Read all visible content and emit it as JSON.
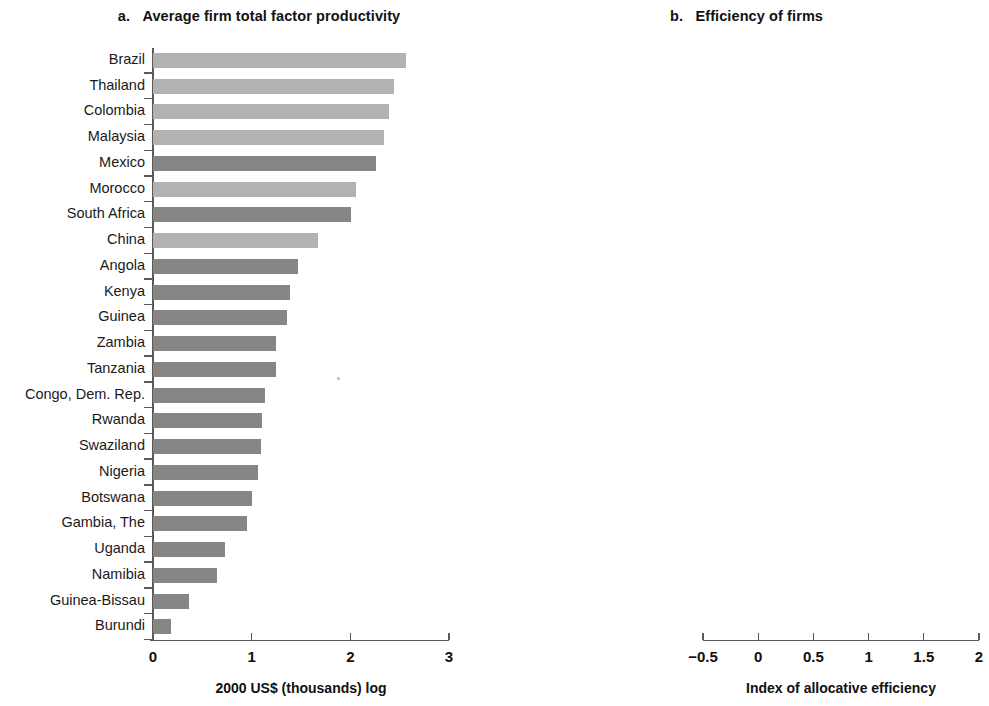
{
  "figure": {
    "panel_a_label": "a.",
    "panel_a_title": "Average firm total factor productivity",
    "panel_b_label": "b.",
    "panel_b_title": "Efficiency of firms",
    "colors": {
      "light_bar": "#b2b2b2",
      "dark_bar": "#868686",
      "axis": "#5a5a5a",
      "text": "#1a1a1a"
    }
  },
  "chart_data": [
    {
      "type": "bar",
      "orientation": "horizontal",
      "panel": "a",
      "title": "a.  Average firm total factor productivity",
      "xlabel": "2000 US$ (thousands) log",
      "ylabel": "",
      "xlim": [
        0,
        3
      ],
      "xticks": [
        0,
        1,
        2,
        3
      ],
      "xticklabels": [
        "0",
        "1",
        "2",
        "3"
      ],
      "grid": false,
      "legend": "none",
      "categories": [
        "Brazil",
        "Thailand",
        "Colombia",
        "Malaysia",
        "Mexico",
        "Morocco",
        "South Africa",
        "China",
        "Angola",
        "Kenya",
        "Guinea",
        "Zambia",
        "Tanzania",
        "Congo, Dem. Rep.",
        "Rwanda",
        "Swaziland",
        "Nigeria",
        "Botswana",
        "Gambia, The",
        "Uganda",
        "Namibia",
        "Guinea-Bissau",
        "Burundi"
      ],
      "values": [
        2.56,
        2.44,
        2.39,
        2.34,
        2.26,
        2.06,
        2.01,
        1.67,
        1.47,
        1.39,
        1.36,
        1.25,
        1.25,
        1.14,
        1.1,
        1.09,
        1.06,
        1.0,
        0.95,
        0.73,
        0.65,
        0.36,
        0.18
      ],
      "shades": [
        "light",
        "light",
        "light",
        "light",
        "dark",
        "light",
        "dark",
        "light",
        "dark",
        "dark",
        "dark",
        "dark",
        "dark",
        "dark",
        "dark",
        "dark",
        "dark",
        "dark",
        "dark",
        "dark",
        "dark",
        "dark",
        "dark"
      ]
    },
    {
      "type": "bar",
      "orientation": "horizontal",
      "panel": "b",
      "title": "b.  Efficiency of firms",
      "xlabel": "Index of allocative efficiency",
      "ylabel": "",
      "xlim": [
        -0.5,
        2
      ],
      "xticks": [
        -0.5,
        0,
        0.5,
        1,
        1.5,
        2
      ],
      "xticklabels": [
        "−0.5",
        "0",
        "0.5",
        "1",
        "1.5",
        "2"
      ],
      "grid": false,
      "legend": "none",
      "categories": [
        "China",
        "Malaysia",
        "Brazil",
        "Colombia",
        "Mexico",
        "Morocco",
        "Burundi",
        "Tanzania",
        "Botswana",
        "South Africa",
        "Thailand",
        "Nigeria",
        "Congo, Dem. Rep.",
        "Swaziland",
        "Uganda",
        "Zambia",
        "Kenya",
        "Angola",
        "Namibia",
        "Guinea-Bissau",
        "Guinea",
        "Gambia, The",
        "Rwanda"
      ],
      "values": [
        1.74,
        1.1,
        1.09,
        1.01,
        0.85,
        0.79,
        0.72,
        0.68,
        0.67,
        0.63,
        0.54,
        0.49,
        0.48,
        0.45,
        0.42,
        0.37,
        0.29,
        0.21,
        0.17,
        0.06,
        0.04,
        -0.02,
        -0.03
      ],
      "shades": [
        "light",
        "light",
        "light",
        "light",
        "light",
        "dark",
        "dark",
        "dark",
        "dark",
        "dark",
        "light",
        "dark",
        "dark",
        "dark",
        "dark",
        "dark",
        "dark",
        "dark",
        "dark",
        "dark",
        "dark",
        "dark",
        "dark"
      ]
    }
  ]
}
